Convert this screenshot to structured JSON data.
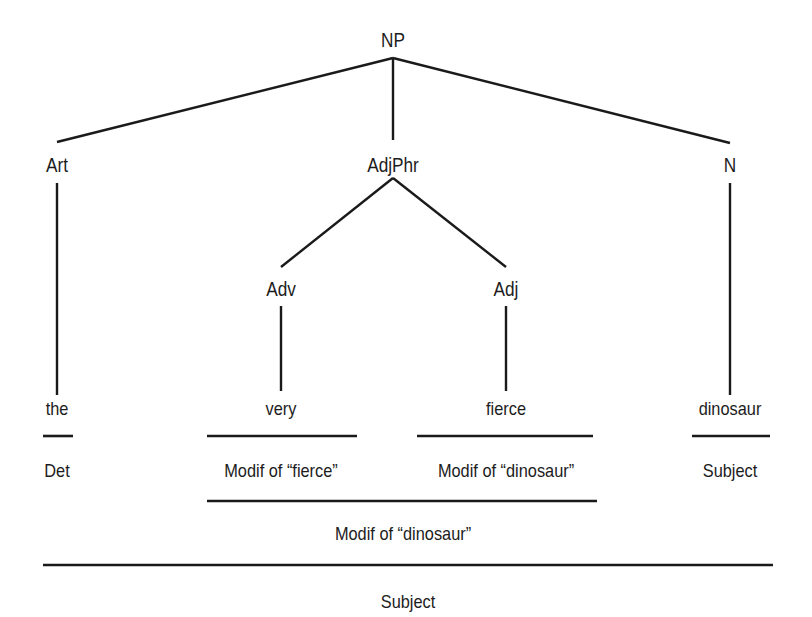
{
  "diagram": {
    "type": "syntax-tree",
    "root": {
      "label": "NP",
      "x": 393,
      "y": 40
    },
    "nodes": [
      {
        "id": "art",
        "label": "Art",
        "x": 57,
        "y": 165
      },
      {
        "id": "adjphr",
        "label": "AdjPhr",
        "x": 393,
        "y": 165
      },
      {
        "id": "n",
        "label": "N",
        "x": 730,
        "y": 165
      },
      {
        "id": "adv",
        "label": "Adv",
        "x": 281,
        "y": 289
      },
      {
        "id": "adj",
        "label": "Adj",
        "x": 506,
        "y": 289
      }
    ],
    "words": [
      {
        "id": "the",
        "label": "the",
        "x": 57,
        "y": 408
      },
      {
        "id": "very",
        "label": "very",
        "x": 281,
        "y": 408
      },
      {
        "id": "fierce",
        "label": "fierce",
        "x": 506,
        "y": 408
      },
      {
        "id": "dinosaur",
        "label": "dinosaur",
        "x": 730,
        "y": 408
      }
    ],
    "functions_level1": [
      {
        "label": "Det",
        "x": 57,
        "y": 470
      },
      {
        "label": "Modif of “fierce”",
        "x": 281,
        "y": 470
      },
      {
        "label": "Modif of “dinosaur”",
        "x": 506,
        "y": 470
      },
      {
        "label": "Subject",
        "x": 730,
        "y": 470
      }
    ],
    "functions_level2": [
      {
        "label": "Modif of “dinosaur”",
        "x": 403,
        "y": 533
      }
    ],
    "functions_level3": [
      {
        "label": "Subject",
        "x": 408,
        "y": 601
      }
    ],
    "edges": [
      {
        "from": "NP",
        "to": "Art",
        "x1": 393,
        "y1": 58,
        "x2": 57,
        "y2": 142
      },
      {
        "from": "NP",
        "to": "AdjPhr",
        "x1": 393,
        "y1": 58,
        "x2": 393,
        "y2": 140
      },
      {
        "from": "NP",
        "to": "N",
        "x1": 393,
        "y1": 58,
        "x2": 730,
        "y2": 143
      },
      {
        "from": "AdjPhr",
        "to": "Adv",
        "x1": 393,
        "y1": 178,
        "x2": 281,
        "y2": 267
      },
      {
        "from": "AdjPhr",
        "to": "Adj",
        "x1": 393,
        "y1": 178,
        "x2": 506,
        "y2": 267
      },
      {
        "from": "Art",
        "to": "the",
        "x1": 57,
        "y1": 183,
        "x2": 57,
        "y2": 395
      },
      {
        "from": "N",
        "to": "dinosaur",
        "x1": 730,
        "y1": 183,
        "x2": 730,
        "y2": 395
      },
      {
        "from": "Adv",
        "to": "very",
        "x1": 281,
        "y1": 306,
        "x2": 281,
        "y2": 391
      },
      {
        "from": "Adj",
        "to": "fierce",
        "x1": 506,
        "y1": 306,
        "x2": 506,
        "y2": 391
      }
    ],
    "underlines": [
      {
        "id": "under-the",
        "x1": 43,
        "x2": 73,
        "y": 436
      },
      {
        "id": "under-very",
        "x1": 207,
        "x2": 357,
        "y": 436
      },
      {
        "id": "under-fierce",
        "x1": 417,
        "x2": 593,
        "y": 436
      },
      {
        "id": "under-dinosaur",
        "x1": 692,
        "x2": 770,
        "y": 436
      },
      {
        "id": "under-adjphrase",
        "x1": 207,
        "x2": 597,
        "y": 501
      },
      {
        "id": "under-np",
        "x1": 43,
        "x2": 773,
        "y": 565
      }
    ]
  }
}
